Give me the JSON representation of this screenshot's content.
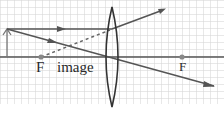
{
  "diagram": {
    "type": "ray-diagram-convex-lens",
    "labels": {
      "focal_left": "F",
      "image": "image",
      "focal_right": "F"
    },
    "colors": {
      "grid": "#d4d4d4",
      "ray": "#555555",
      "lens": "#333333",
      "axis": "#555555",
      "focal_point": "#777777",
      "background": "#ffffff"
    },
    "grid": {
      "cell": 7,
      "top": 0,
      "bottom": 104
    },
    "optical_axis_y": 57,
    "object": {
      "x": 7,
      "base_y": 57,
      "tip_y": 29
    },
    "lens": {
      "cx": 112,
      "top": 7,
      "bottom": 107,
      "half_width": 6
    },
    "focal_points": {
      "left_x": 41,
      "right_x": 182
    },
    "rays": [
      {
        "name": "parallel-ray",
        "points": [
          [
            7,
            29
          ],
          [
            112,
            29
          ],
          [
            165,
            9
          ]
        ],
        "style": "solid",
        "arrow_at": [
          62,
          29
        ]
      },
      {
        "name": "center-ray",
        "points": [
          [
            7,
            29
          ],
          [
            215,
            87
          ]
        ],
        "style": "solid",
        "arrow_at": [
          55,
          42
        ]
      },
      {
        "name": "virtual-extension",
        "points": [
          [
            41,
            57
          ],
          [
            110,
            30
          ]
        ],
        "style": "dashed"
      }
    ]
  }
}
